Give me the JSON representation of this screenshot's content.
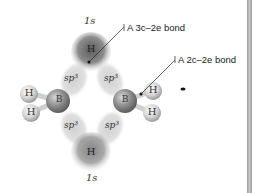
{
  "diagram": {
    "title_fragment": "",
    "labels": {
      "bond_3c2e": "A 3c–2e bond",
      "bond_2c2e": "A 2c–2e bond"
    },
    "orbitals": {
      "top_1s": "1s",
      "bottom_1s": "1s",
      "sp3": "sp³"
    },
    "atoms": {
      "boron": "B",
      "hydrogen": "H"
    },
    "colors": {
      "orbital_dark": "#6e6e6e",
      "orbital_light": "#d6d6d6",
      "atom_light": "#e4e4e4",
      "boron": "#8a8a8a",
      "sidebar": "#a8a8a8"
    }
  }
}
